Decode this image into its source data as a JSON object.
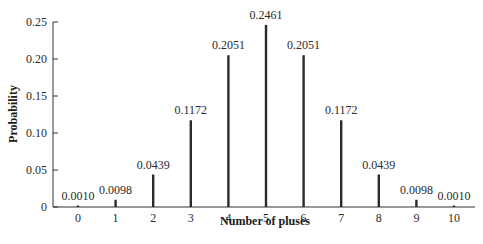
{
  "chart_data": {
    "type": "bar",
    "subtype": "stem",
    "title": "",
    "xlabel": "Number of pluses",
    "ylabel": "Probability",
    "categories": [
      "0",
      "1",
      "2",
      "3",
      "4",
      "5",
      "6",
      "7",
      "8",
      "9",
      "10"
    ],
    "values": [
      0.001,
      0.0098,
      0.0439,
      0.1172,
      0.2051,
      0.2461,
      0.2051,
      0.1172,
      0.0439,
      0.0098,
      0.001
    ],
    "value_labels": [
      "0.0010",
      "0.0098",
      "0.0439",
      "0.1172",
      "0.2051",
      "0.2461",
      "0.2051",
      "0.1172",
      "0.0439",
      "0.0098",
      "0.0010"
    ],
    "yticks": [
      "0",
      "0.05",
      "0.10",
      "0.15",
      "0.20",
      "0.25"
    ],
    "ytick_values": [
      0,
      0.05,
      0.1,
      0.15,
      0.2,
      0.25
    ],
    "ylim": [
      0,
      0.25
    ],
    "grid": false,
    "legend": null,
    "colors": {
      "bar": "#2b2b2b",
      "axis": "#333333",
      "text": "#2a2a2a"
    }
  }
}
